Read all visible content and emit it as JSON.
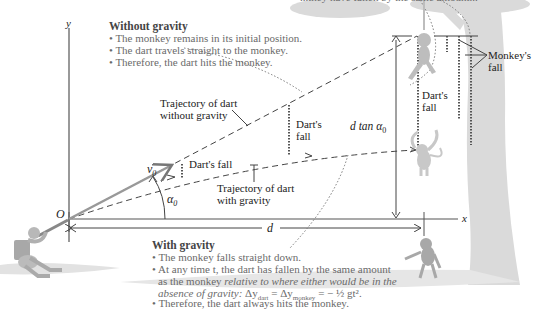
{
  "top_clip": "...they have fallen by the same amount...",
  "axes": {
    "y_label": "y",
    "x_label": "x",
    "origin_label": "O"
  },
  "without_gravity": {
    "heading": "Without gravity",
    "bullets": [
      "• The monkey remains in its initial position.",
      "• The dart travels straight to the monkey.",
      "• Therefore, the dart hits the monkey."
    ]
  },
  "with_gravity": {
    "heading": "With gravity",
    "bullets": [
      "• The monkey falls straight down.",
      "• At any time t, the dart has fallen by the same amount",
      "as the monkey",
      "relative to where either would be in the",
      "absence of gravity:",
      "Δy_dart = Δy_monkey = −½gt².",
      "• Therefore, the dart always hits the monkey."
    ],
    "equation": {
      "lhs": "Δy",
      "sub1": "dart",
      "mid": " = Δy",
      "sub2": "monkey",
      "rhs": " = − ½ gt²."
    }
  },
  "labels": {
    "traj_no_gravity_1": "Trajectory of dart",
    "traj_no_gravity_2": "without gravity",
    "traj_gravity_1": "Trajectory of dart",
    "traj_gravity_2": "with gravity",
    "darts_fall_small": "Dart's fall",
    "darts_fall_mid_1": "Dart's",
    "darts_fall_mid_2": "fall",
    "darts_fall_right_1": "Dart's",
    "darts_fall_right_2": "fall",
    "monkeys_fall_1": "Monkey's",
    "monkeys_fall_2": "fall",
    "v0": "v",
    "v0_sub": "0",
    "alpha0": "α",
    "alpha0_sub": "0",
    "d": "d",
    "dtan": "d tan α",
    "dtan_sub": "0"
  },
  "colors": {
    "axis": "#555555",
    "dash": "#444444",
    "dotted_fall": "#555555",
    "arrow_grey": "#999999",
    "tree": "#d6d6d6",
    "ground": "#dcdcdc",
    "figure": "#b0b0b0"
  }
}
